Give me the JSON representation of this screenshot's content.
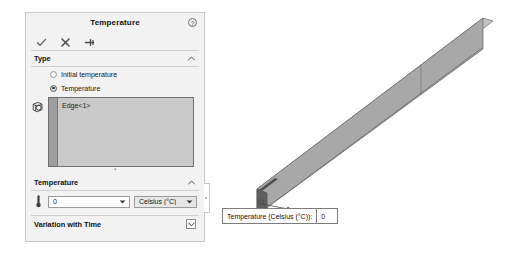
{
  "panel": {
    "title": "Temperature",
    "help_icon": "help-circle-icon",
    "toolbar": {
      "ok_label": "OK",
      "cancel_label": "Cancel",
      "pin_label": "Keep Visible"
    },
    "sections": {
      "type": {
        "label": "Type",
        "collapse_state": "expanded",
        "options": [
          {
            "label": "Initial temperature",
            "selected": false
          },
          {
            "label": "Temperature",
            "selected": true
          }
        ],
        "selection": {
          "icon": "faces-edges-icon",
          "items": [
            "Edge<1>"
          ]
        }
      },
      "temperature": {
        "label": "Temperature",
        "collapse_state": "expanded",
        "icon": "thermometer-icon",
        "value": "0",
        "units": "Celsius (°C)"
      },
      "variation": {
        "label": "Variation with Time",
        "collapse_state": "collapsed"
      }
    }
  },
  "viewport": {
    "model_name": "angled-beam",
    "colors": {
      "face_front": "#a6a6a6",
      "face_top": "#c2c2c2",
      "face_end": "#6f6f6f",
      "outline": "#5a5a5a"
    }
  },
  "callout": {
    "label": "Temperature (Celsius (°C)):",
    "value": "0"
  }
}
